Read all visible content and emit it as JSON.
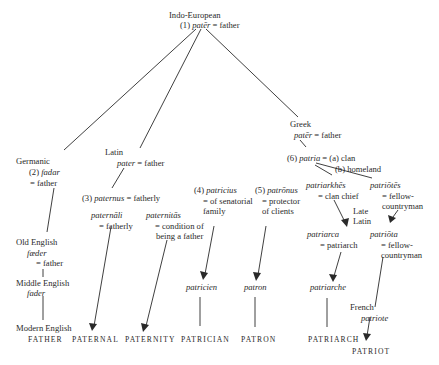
{
  "diagram": {
    "root": {
      "language": "Indo-European",
      "num": "(1)",
      "word": "patēr",
      "gloss": "= father"
    },
    "germanic": {
      "language": "Germanic",
      "num": "(2)",
      "word": "fadar",
      "gloss": "= father"
    },
    "latin": {
      "language": "Latin",
      "word": "pater",
      "gloss": "= father"
    },
    "greek": {
      "language": "Greek",
      "word": "patēr",
      "gloss": "= father",
      "patria": {
        "num": "(6)",
        "word": "patria",
        "gloss_a": "= (a) clan",
        "gloss_b": "(b) homeland"
      }
    },
    "paternus": {
      "num": "(3)",
      "word": "paternus",
      "gloss": "= fatherly"
    },
    "paternali": {
      "word": "paternāli",
      "gloss": "= fatherly"
    },
    "paternitas": {
      "word": "paternitās",
      "gloss_1": "= condition of",
      "gloss_2": "being a father"
    },
    "patricius": {
      "num": "(4)",
      "word": "patricius",
      "gloss_1": "= of senatorial",
      "gloss_2": "family"
    },
    "patronus": {
      "num": "(5)",
      "word": "patrōnus",
      "gloss_1": "= protector",
      "gloss_2": "of clients"
    },
    "patriarkhes": {
      "word": "patriarkhēs",
      "gloss": "= clan chief"
    },
    "patriotes": {
      "word": "patriōtēs",
      "gloss_1": "= fellow-",
      "gloss_2": "countryman"
    },
    "late_latin": {
      "line1": "Late",
      "line2": "Latin"
    },
    "patriarca": {
      "word": "patriarca",
      "gloss": "= patriarch"
    },
    "patriota": {
      "word": "patriōta",
      "gloss_1": "= fellow-",
      "gloss_2": "countryman"
    },
    "old_english": {
      "language": "Old English",
      "word": "fæder",
      "gloss": "= father"
    },
    "middle_english": {
      "language": "Middle English",
      "word": "fader"
    },
    "modern_english": {
      "language": "Modern English"
    },
    "patricien": {
      "word": "patricien"
    },
    "patron": {
      "word": "patron"
    },
    "patriarche": {
      "word": "patriarche"
    },
    "french": {
      "language": "French",
      "word": "patriote"
    },
    "results": {
      "father": "Father",
      "paternal": "Paternal",
      "paternity": "Paternity",
      "patrician": "Patrician",
      "patron": "Patron",
      "patriarch": "Patriarch",
      "patriot": "Patriot"
    }
  }
}
